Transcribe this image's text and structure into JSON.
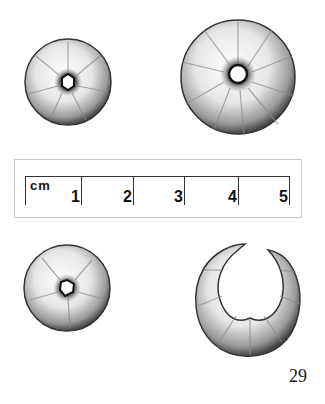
{
  "figure": {
    "page_number": "29",
    "specimens": [
      {
        "id": "top-left",
        "shape": "ring",
        "cx": 68,
        "cy": 82,
        "r": 44,
        "lobes": 9,
        "hole_r": 8
      },
      {
        "id": "top-right",
        "shape": "ring",
        "cx": 238,
        "cy": 77,
        "r": 58,
        "lobes": 12,
        "hole_r": 10
      },
      {
        "id": "bottom-left",
        "shape": "ring",
        "cx": 67,
        "cy": 288,
        "r": 44,
        "lobes": 8,
        "hole_r": 8
      },
      {
        "id": "bottom-right",
        "shape": "open-ring",
        "cx": 245,
        "cy": 305,
        "r": 56,
        "lobes": 9
      }
    ],
    "scale_bar": {
      "unit": "cm",
      "ticks": [
        {
          "label": "1",
          "x": 81
        },
        {
          "label": "2",
          "x": 133
        },
        {
          "label": "3",
          "x": 184
        },
        {
          "label": "4",
          "x": 238
        },
        {
          "label": "5",
          "x": 289
        }
      ]
    }
  }
}
